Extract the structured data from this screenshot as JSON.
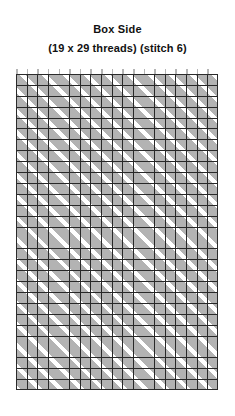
{
  "chart": {
    "title": "Box Side",
    "subtitle": "(19 x 29 threads) (stitch 6)"
  },
  "chart_data": {
    "type": "heatmap",
    "title": "Box Side",
    "subtitle": "(19 x 29 threads) (stitch 6)",
    "xlabel": "",
    "ylabel": "",
    "grid": true,
    "legend": "none",
    "columns": 19,
    "rows": 29,
    "cell_width_px": 10.63,
    "cell_height_px": 10.9,
    "stitch_number": 6,
    "stitch_direction": "diagonal-up-right",
    "stitch_repeat_cells": 2,
    "grid_line_color": "#282828",
    "stitch_fill_color": "#b3b3b3",
    "background_color": "#ffffff",
    "top_tick_count": 19,
    "categories": [
      "col-1",
      "col-2",
      "col-3",
      "col-4",
      "col-5",
      "col-6",
      "col-7",
      "col-8",
      "col-9",
      "col-10",
      "col-11",
      "col-12",
      "col-13",
      "col-14",
      "col-15",
      "col-16",
      "col-17",
      "col-18",
      "col-19"
    ],
    "values": [
      1,
      0,
      1,
      0,
      1,
      0,
      1,
      0,
      1,
      0,
      1,
      0,
      1,
      0,
      1,
      0,
      1,
      0,
      1
    ]
  }
}
